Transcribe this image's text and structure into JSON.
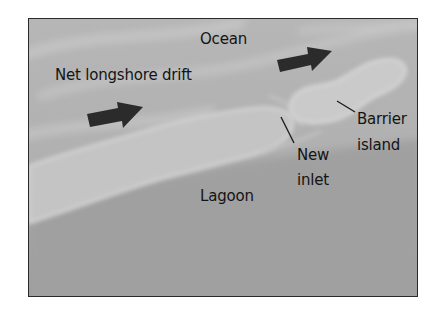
{
  "diagram": {
    "labels": {
      "ocean": "Ocean",
      "drift": "Net longshore drift",
      "barrier_line1": "Barrier",
      "barrier_line2": "island",
      "inlet_line1": "New",
      "inlet_line2": "inlet",
      "lagoon": "Lagoon"
    },
    "colors": {
      "ocean": "#b4b4b4",
      "ocean_swirl": "#c6c6c6",
      "land": "#c9c9c9",
      "land_edge": "#d8d8d8",
      "lagoon": "#9e9e9e",
      "arrow": "#2b2b2b",
      "frame": "#2a2a2a",
      "text": "#141414"
    },
    "arrows": [
      {
        "name": "drift-arrow-left",
        "tail": [
          86,
          115
        ],
        "tip": [
          142,
          106
        ]
      },
      {
        "name": "drift-arrow-right",
        "tail": [
          276,
          62
        ],
        "tip": [
          331,
          50
        ]
      }
    ]
  }
}
